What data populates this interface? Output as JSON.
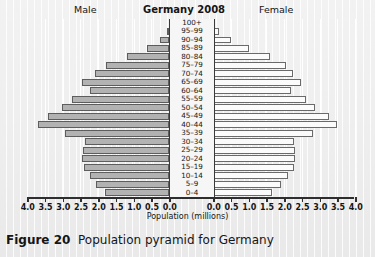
{
  "header": {
    "male_label": "Male",
    "title": "Germany 2008",
    "female_label": "Female"
  },
  "caption": {
    "figure_number": "Figure 20",
    "text": "Population pyramid for Germany"
  },
  "axis": {
    "xlabel": "Population (millions)",
    "ticks_left": [
      "4.0",
      "3.5",
      "3.0",
      "2.5",
      "2.0",
      "1.5",
      "1.0",
      "0.5",
      "0.0"
    ],
    "ticks_right": [
      "0.0",
      "0.5",
      "1.0",
      "1.5",
      "2.0",
      "2.5",
      "3.0",
      "3.5",
      "4.0"
    ],
    "max": 4.0,
    "step": 0.5
  },
  "colors": {
    "male_fill": "#b2b2b2",
    "male_stroke": "#5d5d5d",
    "female_fill": "#fbfbfb",
    "female_stroke": "#6a6a6a",
    "axis": "#2e2e2e",
    "background": "#efefef"
  },
  "chart_data": {
    "type": "bar",
    "title": "Germany 2008",
    "subtitle": "Population pyramid",
    "xlabel": "Population (millions)",
    "ylabel": "Age group",
    "orientation": "horizontal-diverging",
    "xlim": [
      0,
      4.0
    ],
    "grid": true,
    "legend_position": "top",
    "categories": [
      "0–4",
      "5–9",
      "10–14",
      "15–19",
      "20–24",
      "25–29",
      "30–34",
      "35–39",
      "40–44",
      "45–49",
      "50–54",
      "55–59",
      "60–64",
      "65–69",
      "70–74",
      "75–79",
      "80–84",
      "85–89",
      "90–94",
      "95–99",
      "100+"
    ],
    "series": [
      {
        "name": "Male",
        "direction": "left",
        "values": [
          1.8,
          2.05,
          2.23,
          2.4,
          2.45,
          2.42,
          2.38,
          2.92,
          3.7,
          3.42,
          3.02,
          2.72,
          2.22,
          2.45,
          2.08,
          1.78,
          1.18,
          0.62,
          0.26,
          0.06,
          0.01
        ]
      },
      {
        "name": "Female",
        "direction": "right",
        "values": [
          1.66,
          1.92,
          2.1,
          2.28,
          2.32,
          2.3,
          2.28,
          2.82,
          3.5,
          3.28,
          2.88,
          2.62,
          2.2,
          2.48,
          2.24,
          2.05,
          1.6,
          1.02,
          0.52,
          0.17,
          0.03
        ]
      }
    ]
  }
}
